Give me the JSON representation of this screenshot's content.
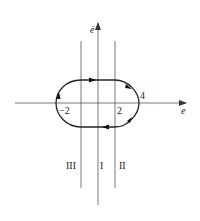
{
  "diagram": {
    "type": "phase-plane",
    "axes": {
      "x_label": "e",
      "y_label": "ė"
    },
    "tick_labels": {
      "neg_two": "−2",
      "two": "2",
      "four": "4"
    },
    "regions": {
      "left": "III",
      "middle": "I",
      "right": "II"
    },
    "trajectory": {
      "shape": "closed limit cycle",
      "direction": "clockwise"
    },
    "colors": {
      "line": "#333333",
      "background": "#ffffff"
    }
  }
}
